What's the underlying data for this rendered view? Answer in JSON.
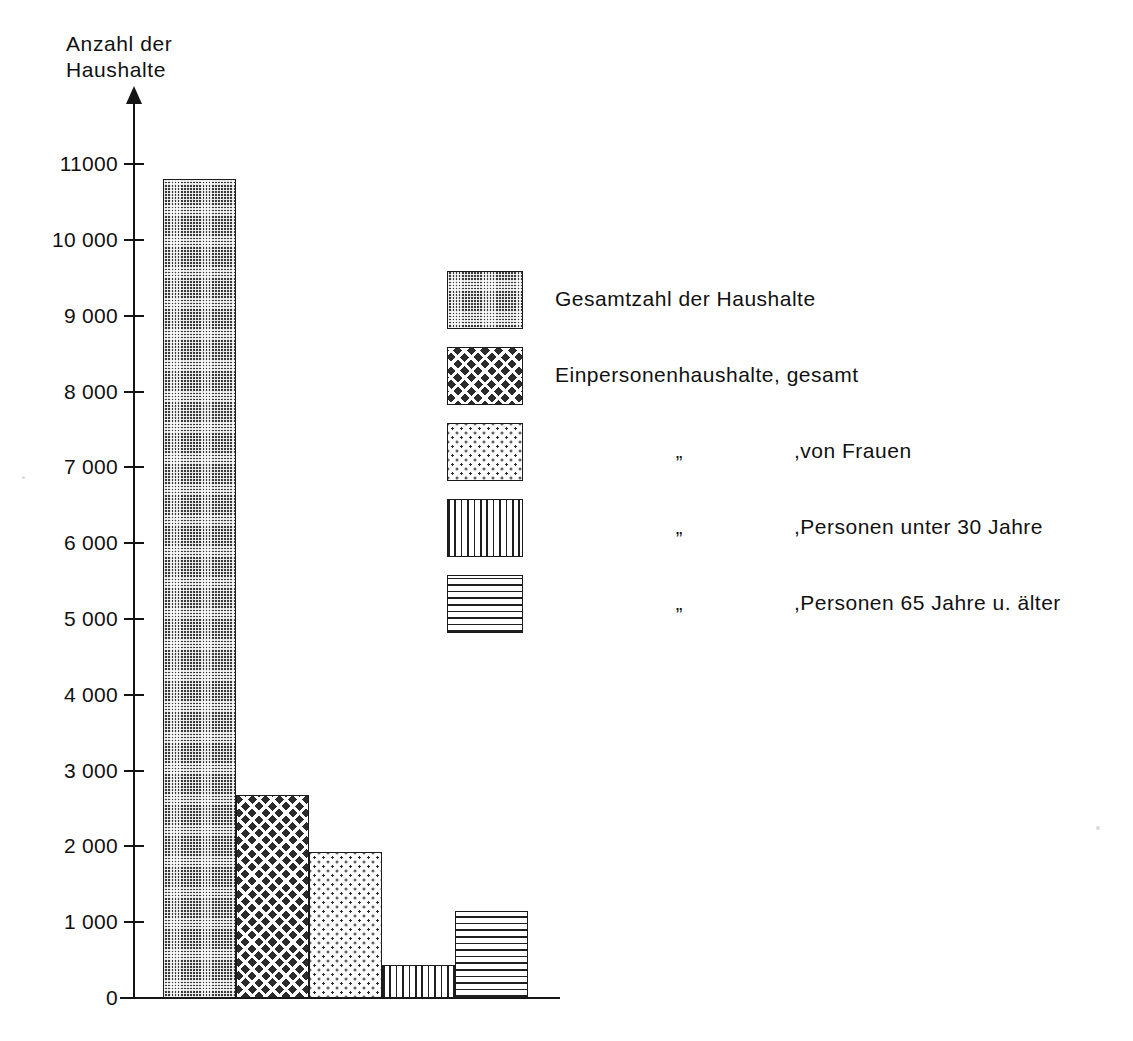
{
  "chart_data": {
    "type": "bar",
    "title": "",
    "ylabel": "Anzahl der\nHaushalte",
    "xlabel": "",
    "ylim": [
      0,
      11000
    ],
    "grid": false,
    "legend_position": "inside-upper-right",
    "yticks": [
      0,
      1000,
      2000,
      3000,
      4000,
      5000,
      6000,
      7000,
      8000,
      9000,
      10000,
      11000
    ],
    "ytick_labels": [
      "0",
      "1 000",
      "2 000",
      "3 000",
      "4 000",
      "5 000",
      "6 000",
      "7 000",
      "8 000",
      "9 000",
      "10 000",
      "11000"
    ],
    "categories": [
      "Gesamtzahl der Haushalte",
      "Einpersonenhaushalte, gesamt",
      "Einpersonenhaushalte, von Frauen",
      "Einpersonenhaushalte, Personen unter 30 Jahre",
      "Einpersonenhaushalte, Personen 65 Jahre u. älter"
    ],
    "values": [
      10800,
      2680,
      1930,
      440,
      1150
    ],
    "bar_patterns": [
      "dark-checker",
      "cross-hatch",
      "stipple-dots",
      "vertical-lines",
      "horizontal-lines"
    ]
  },
  "axis": {
    "title_line1": "Anzahl der",
    "title_line2": "Haushalte",
    "ticks": [
      {
        "value": 11000,
        "label": "11000"
      },
      {
        "value": 10000,
        "label": "10 000"
      },
      {
        "value": 9000,
        "label": "9 000"
      },
      {
        "value": 8000,
        "label": "8 000"
      },
      {
        "value": 7000,
        "label": "7 000"
      },
      {
        "value": 6000,
        "label": "6 000"
      },
      {
        "value": 5000,
        "label": "5 000"
      },
      {
        "value": 4000,
        "label": "4 000"
      },
      {
        "value": 3000,
        "label": "3 000"
      },
      {
        "value": 2000,
        "label": "2 000"
      },
      {
        "value": 1000,
        "label": "1 000"
      },
      {
        "value": 0,
        "label": "0"
      }
    ]
  },
  "legend": {
    "ditto_mark": "„",
    "items": [
      {
        "pattern": "dark-checker",
        "label": "Gesamtzahl der Haushalte",
        "ditto": "",
        "indent": 0
      },
      {
        "pattern": "cross-hatch",
        "label": "Einpersonenhaushalte, gesamt",
        "ditto": "",
        "indent": 0
      },
      {
        "pattern": "stipple-dots",
        "label": ",von Frauen",
        "ditto": "„",
        "indent": 1
      },
      {
        "pattern": "vertical-lines",
        "label": ",Personen unter  30 Jahre",
        "ditto": "„",
        "indent": 1
      },
      {
        "pattern": "horizontal-lines",
        "label": ",Personen 65 Jahre u. älter",
        "ditto": "„",
        "indent": 1
      }
    ]
  },
  "colors": {
    "ink": "#1a1a1a",
    "background": "#ffffff",
    "bar_dark": "#3b3b3b"
  }
}
